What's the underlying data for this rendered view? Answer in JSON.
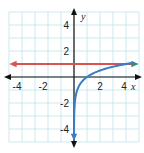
{
  "chart_data": {
    "type": "line",
    "title": "",
    "xlabel": "x",
    "ylabel": "y",
    "xlim": [
      -5,
      5
    ],
    "ylim": [
      -5,
      5
    ],
    "grid": true,
    "x_ticks": [
      "-4",
      "-2",
      "2",
      "4"
    ],
    "y_ticks": [
      "4",
      "2",
      "-2",
      "-4"
    ],
    "series": [
      {
        "name": "horizontal line y = 1",
        "color": "#d9534f",
        "points": [
          [
            -4.8,
            1
          ],
          [
            4.8,
            1
          ]
        ],
        "arrows": "both"
      },
      {
        "name": "curve y = log4(x)",
        "color": "#3a7dc4",
        "points": [
          [
            0.004,
            -4
          ],
          [
            0.0625,
            -2
          ],
          [
            0.25,
            -1
          ],
          [
            0.5,
            -0.5
          ],
          [
            1,
            0
          ],
          [
            2,
            0.5
          ],
          [
            4,
            1
          ],
          [
            4.8,
            1.13
          ]
        ],
        "arrows": "both"
      }
    ],
    "colors": {
      "grid": "#bfe3ea",
      "axis": "#111111",
      "curve": "#3a7dc4",
      "line": "#d9534f",
      "line_end_arrow": "#2f8f7a"
    }
  }
}
